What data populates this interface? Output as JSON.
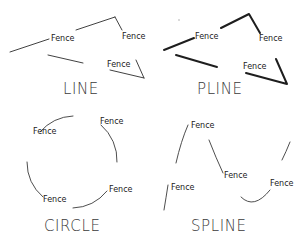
{
  "diagram": {
    "label_text": "Fence",
    "colors": {
      "background": "#ffffff",
      "stroke": "#2b2b2b",
      "text": "#1a1a1a"
    },
    "panels": [
      {
        "id": "line",
        "title": "LINE",
        "linetype_label": "Fence",
        "labels": [
          "Fence",
          "Fence",
          "Fence"
        ]
      },
      {
        "id": "pline",
        "title": "PLINE",
        "linetype_label": "Fence",
        "labels": [
          "Fence",
          "Fence",
          "Fence"
        ]
      },
      {
        "id": "circle",
        "title": "CIRCLE",
        "linetype_label": "Fence",
        "labels": [
          "Fence",
          "Fence",
          "Fence"
        ]
      },
      {
        "id": "spline",
        "title": "SPLINE",
        "linetype_label": "Fence",
        "labels": [
          "Fence",
          "Fence",
          "Fence",
          "Fence"
        ]
      }
    ]
  }
}
